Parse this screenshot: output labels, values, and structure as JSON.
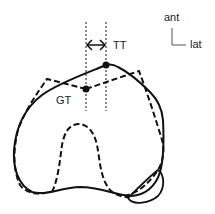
{
  "diagram": {
    "type": "anatomical-cross-section",
    "labels": {
      "tt": "TT",
      "gt": "GT",
      "ant": "ant",
      "lat": "lat"
    },
    "markers": [
      {
        "name": "TT",
        "x": 106,
        "y": 65
      },
      {
        "name": "GT",
        "x": 86,
        "y": 89
      }
    ],
    "measurement": {
      "from": "GT",
      "to": "TT",
      "style": "double-arrow"
    },
    "colors": {
      "stroke": "#111111",
      "background": "#ffffff"
    }
  }
}
